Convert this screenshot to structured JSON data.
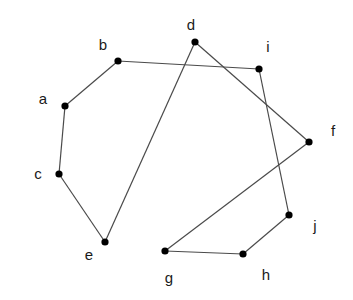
{
  "diagram": {
    "type": "graph",
    "nodes": [
      {
        "id": "a",
        "label": "a"
      },
      {
        "id": "b",
        "label": "b"
      },
      {
        "id": "c",
        "label": "c"
      },
      {
        "id": "d",
        "label": "d"
      },
      {
        "id": "e",
        "label": "e"
      },
      {
        "id": "f",
        "label": "f"
      },
      {
        "id": "g",
        "label": "g"
      },
      {
        "id": "h",
        "label": "h"
      },
      {
        "id": "i",
        "label": "i"
      },
      {
        "id": "j",
        "label": "j"
      }
    ],
    "edges": [
      [
        "a",
        "b"
      ],
      [
        "a",
        "c"
      ],
      [
        "c",
        "e"
      ],
      [
        "e",
        "d"
      ],
      [
        "d",
        "f"
      ],
      [
        "b",
        "i"
      ],
      [
        "i",
        "j"
      ],
      [
        "j",
        "h"
      ],
      [
        "h",
        "g"
      ],
      [
        "g",
        "f"
      ]
    ],
    "colors": {
      "edge": "#4a4a4a",
      "node": "#000000",
      "label": "#1a1a1a",
      "background": "#ffffff"
    }
  }
}
